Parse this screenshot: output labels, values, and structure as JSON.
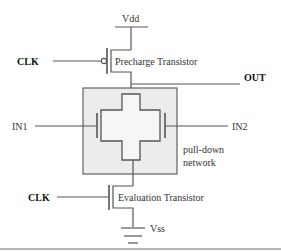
{
  "diagram": {
    "type": "dynamic CMOS logic gate schematic",
    "labels": {
      "vdd": "Vdd",
      "vss": "Vss",
      "clk_top": "CLK",
      "clk_bottom": "CLK",
      "out": "OUT",
      "in1": "IN1",
      "in2": "IN2",
      "precharge": "Precharge Transistor",
      "evaluation": "Evaluation Transistor",
      "pulldown_line1": "pull-down",
      "pulldown_line2": "network"
    },
    "colors": {
      "box_fill": "#ececec",
      "wire": "#555555",
      "background": "#ffffff",
      "bottom_rule": "#9a9a9a"
    }
  }
}
